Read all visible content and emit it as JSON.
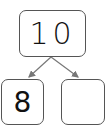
{
  "diagram": {
    "type": "number-bond",
    "whole": {
      "value": "10"
    },
    "parts": [
      {
        "value": "8"
      },
      {
        "value": ""
      }
    ],
    "colors": {
      "border": "#555555",
      "arrow": "#777777",
      "text": "#111111"
    }
  }
}
